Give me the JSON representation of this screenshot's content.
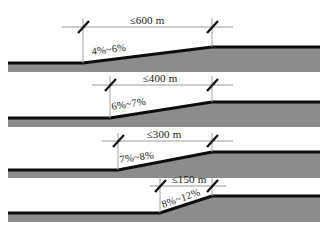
{
  "figure": {
    "kind": "road-gradient-cross-sections",
    "panel_count": 4,
    "colors": {
      "background": "#ffffff",
      "ground_fill": "#8c8c8c",
      "ground_edge": "#0d0d0d",
      "dimension_line": "#8f8f8f",
      "tick": "#141414",
      "text": "#1a1a1a"
    }
  },
  "panels": [
    {
      "id": "panel-1",
      "length_label": "≤600 m",
      "grade_label": "4%~6%",
      "length_value": 600,
      "length_unit": "m",
      "length_comparator": "≤",
      "grade_min_percent": 4,
      "grade_max_percent": 6
    },
    {
      "id": "panel-2",
      "length_label": "≤400 m",
      "grade_label": "6%~7%",
      "length_value": 400,
      "length_unit": "m",
      "length_comparator": "≤",
      "grade_min_percent": 6,
      "grade_max_percent": 7
    },
    {
      "id": "panel-3",
      "length_label": "≤300 m",
      "grade_label": "7%~8%",
      "length_value": 300,
      "length_unit": "m",
      "length_comparator": "≤",
      "grade_min_percent": 7,
      "grade_max_percent": 8
    },
    {
      "id": "panel-4",
      "length_label": "≤150 m",
      "grade_label": "8%~12%",
      "length_value": 150,
      "length_unit": "m",
      "length_comparator": "≤",
      "grade_min_percent": 8,
      "grade_max_percent": 12
    }
  ]
}
